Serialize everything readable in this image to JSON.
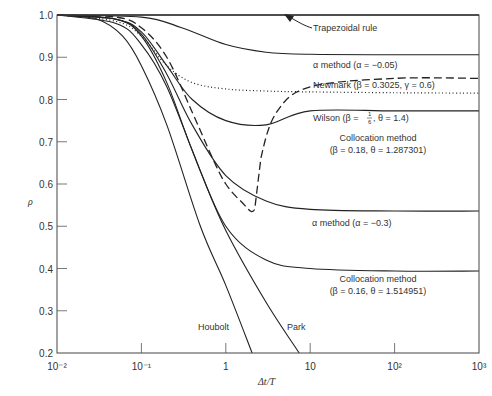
{
  "chart_data": {
    "type": "line",
    "title": "",
    "xlabel": "Δt/T",
    "ylabel": "ρ",
    "xscale": "log",
    "xlim": [
      0.01,
      1000
    ],
    "ylim": [
      0.2,
      1.0
    ],
    "grid": false,
    "x_ticks": [
      "10⁻²",
      "10⁻¹",
      "1",
      "10",
      "10²",
      "10³"
    ],
    "y_ticks": [
      "0.2",
      "0.3",
      "0.4",
      "0.5",
      "0.6",
      "0.7",
      "0.8",
      "0.9",
      "1.0"
    ],
    "series": [
      {
        "name": "Trapezoidal rule",
        "style": "solid",
        "x": [
          0.01,
          1000
        ],
        "y": [
          1.0,
          1.0
        ]
      },
      {
        "name": "α method (α = −0.05)",
        "style": "solid",
        "x": [
          0.01,
          0.1,
          0.3,
          1,
          3,
          10,
          100,
          1000
        ],
        "y": [
          1.0,
          0.995,
          0.97,
          0.93,
          0.912,
          0.907,
          0.906,
          0.906
        ]
      },
      {
        "name": "Newmark (β = 0.3025, γ = 0.6)",
        "style": "dotted",
        "x": [
          0.01,
          0.05,
          0.1,
          0.2,
          0.4,
          1,
          3,
          10,
          100,
          1000
        ],
        "y": [
          1.0,
          0.985,
          0.95,
          0.88,
          0.84,
          0.825,
          0.82,
          0.818,
          0.816,
          0.815
        ]
      },
      {
        "name": "Wilson (β = 1/6, θ = 1.4)",
        "style": "dashed",
        "x": [
          0.01,
          0.05,
          0.1,
          0.2,
          0.4,
          0.7,
          1.0,
          1.5,
          2.2,
          2.6,
          4,
          10,
          100,
          1000
        ],
        "y": [
          1.0,
          0.995,
          0.97,
          0.9,
          0.77,
          0.66,
          0.6,
          0.56,
          0.54,
          0.66,
          0.77,
          0.83,
          0.85,
          0.85
        ]
      },
      {
        "name": "Collocation method (β = 0.18, θ = 1.287301)",
        "style": "solid",
        "x": [
          0.01,
          0.05,
          0.1,
          0.2,
          0.4,
          1,
          3,
          10,
          100,
          1000
        ],
        "y": [
          1.0,
          0.99,
          0.96,
          0.88,
          0.8,
          0.75,
          0.74,
          0.773,
          0.773,
          0.773
        ]
      },
      {
        "name": "α method (α = −0.3)",
        "style": "solid",
        "x": [
          0.01,
          0.05,
          0.1,
          0.2,
          0.4,
          1,
          3,
          10,
          100,
          1000
        ],
        "y": [
          1.0,
          0.99,
          0.955,
          0.86,
          0.74,
          0.62,
          0.56,
          0.54,
          0.536,
          0.536
        ]
      },
      {
        "name": "Collocation method (β = 0.16, θ = 1.514951)",
        "style": "solid",
        "x": [
          0.01,
          0.05,
          0.1,
          0.2,
          0.4,
          1,
          3,
          10,
          100,
          1000
        ],
        "y": [
          1.0,
          0.99,
          0.95,
          0.84,
          0.68,
          0.5,
          0.42,
          0.4,
          0.394,
          0.394
        ]
      },
      {
        "name": "Houbolt",
        "style": "solid",
        "x": [
          0.01,
          0.03,
          0.06,
          0.1,
          0.2,
          0.5,
          1,
          2.05
        ],
        "y": [
          1.0,
          0.99,
          0.95,
          0.88,
          0.74,
          0.5,
          0.36,
          0.2
        ]
      },
      {
        "name": "Park",
        "style": "solid",
        "x": [
          0.01,
          0.05,
          0.1,
          0.2,
          0.5,
          1,
          3,
          7.4
        ],
        "y": [
          1.0,
          0.98,
          0.93,
          0.83,
          0.63,
          0.49,
          0.32,
          0.2
        ]
      }
    ],
    "annotations": [
      {
        "text": "Trapezoidal rule",
        "x": 50,
        "y": 0.98
      },
      {
        "text": "α method (α = −0.05)",
        "x": 60,
        "y": 0.93
      },
      {
        "text": "Newmark (β = 0.3025, γ = 0.6)",
        "x": 60,
        "y": 0.855
      },
      {
        "text": "Wilson (β = 1/6, θ = 1.4)",
        "x": 60,
        "y": 0.78
      },
      {
        "text": "Collocation method (β = 0.18, θ = 1.287301)",
        "x": 60,
        "y": 0.71
      },
      {
        "text": "α method (α = −0.3)",
        "x": 60,
        "y": 0.49
      },
      {
        "text": "Collocation method (β = 0.16, θ = 1.514951)",
        "x": 60,
        "y": 0.34
      },
      {
        "text": "Houbolt",
        "x": 0.5,
        "y": 0.24
      },
      {
        "text": "Park",
        "x": 4,
        "y": 0.24
      }
    ]
  },
  "labels": {
    "ylabel": "ρ",
    "xlabel": "Δt/T",
    "trap": "Trapezoidal rule",
    "alpha005": "α method (α = −0.05)",
    "newmark": "Newmark (β = 0.3025, γ = 0.6)",
    "wilson_a": "Wilson (β = ",
    "wilson_frac_n": "1",
    "wilson_frac_d": "6",
    "wilson_b": ", θ = 1.4)",
    "coll1_a": "Collocation method",
    "coll1_b": "(β = 0.18, θ = 1.287301)",
    "alpha03": "α method (α = −0.3)",
    "coll2_a": "Collocation method",
    "coll2_b": "(β = 0.16, θ = 1.514951)",
    "houbolt": "Houbolt",
    "park": "Park"
  }
}
